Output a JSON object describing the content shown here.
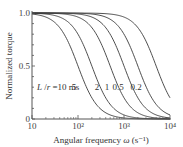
{
  "chart_data": {
    "type": "line",
    "title": "",
    "xlabel": "Angular frequency ω (s⁻¹)",
    "ylabel": "Normalized torque",
    "xscale": "log",
    "xlim": [
      10,
      10000
    ],
    "ylim": [
      0,
      1.0
    ],
    "x_ticks": [
      {
        "value": 10,
        "label": "10"
      },
      {
        "value": 100,
        "label": "10²"
      },
      {
        "value": 1000,
        "label": "10³"
      },
      {
        "value": 10000,
        "label": "10⁴"
      }
    ],
    "y_ticks": [
      {
        "value": 0,
        "label": "0"
      },
      {
        "value": 0.5,
        "label": "0.5"
      },
      {
        "value": 1.0,
        "label": "1.0"
      }
    ],
    "grid": false,
    "legend": "inline labels along curves",
    "parameter_label": "L / r",
    "model": "torque = 1 / (1 + (ω·τ)²), τ = L/r",
    "series": [
      {
        "name": "L/r = 10 ms",
        "tau_s": 0.01,
        "label": "L /r = 10 ms",
        "x": [
          10,
          31.6,
          100,
          316,
          1000,
          3162,
          10000
        ],
        "values": [
          0.99,
          0.91,
          0.5,
          0.09,
          0.01,
          0.0,
          0.0
        ]
      },
      {
        "name": "L/r = 5 ms",
        "tau_s": 0.005,
        "label": "5",
        "x": [
          10,
          31.6,
          100,
          316,
          1000,
          3162,
          10000
        ],
        "values": [
          1.0,
          0.98,
          0.8,
          0.29,
          0.04,
          0.0,
          0.0
        ]
      },
      {
        "name": "L/r = 2 ms",
        "tau_s": 0.002,
        "label": "2",
        "x": [
          10,
          31.6,
          100,
          316,
          1000,
          3162,
          10000
        ],
        "values": [
          1.0,
          1.0,
          0.96,
          0.71,
          0.2,
          0.02,
          0.0
        ]
      },
      {
        "name": "L/r = 1 ms",
        "tau_s": 0.001,
        "label": "1",
        "x": [
          10,
          31.6,
          100,
          316,
          1000,
          3162,
          10000
        ],
        "values": [
          1.0,
          1.0,
          0.99,
          0.91,
          0.5,
          0.09,
          0.01
        ]
      },
      {
        "name": "L/r = 0.5 ms",
        "tau_s": 0.0005,
        "label": "0.5",
        "x": [
          10,
          31.6,
          100,
          316,
          1000,
          3162,
          10000
        ],
        "values": [
          1.0,
          1.0,
          1.0,
          0.98,
          0.8,
          0.29,
          0.04
        ]
      },
      {
        "name": "L/r = 0.2 ms",
        "tau_s": 0.0002,
        "label": "0.2",
        "x": [
          10,
          31.6,
          100,
          316,
          1000,
          3162,
          10000
        ],
        "values": [
          1.0,
          1.0,
          1.0,
          1.0,
          0.96,
          0.71,
          0.2
        ]
      }
    ]
  },
  "style": {
    "line_color": "#3a3a3a",
    "axis_color": "#555555"
  }
}
